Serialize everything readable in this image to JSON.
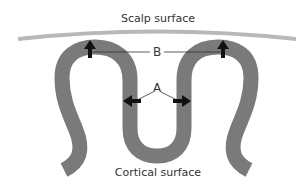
{
  "diagram": {
    "type": "cortical-folding-schematic",
    "labels": {
      "scalp_surface": "Scalp surface",
      "cortical_surface": "Cortical surface",
      "marker_b": "B",
      "marker_a": "A"
    },
    "annotations": [
      {
        "marker": "B",
        "arrows": 2,
        "arrow_direction": "up",
        "meaning": "gyral crown toward scalp"
      },
      {
        "marker": "A",
        "arrows": 2,
        "arrow_direction": "outward-horizontal",
        "meaning": "sulcal walls"
      }
    ],
    "colors": {
      "cortex_band": "#7a7a7a",
      "scalp_line": "#b8b8b8",
      "arrow": "#111111",
      "leader_line": "#333333",
      "text": "#333333",
      "background": "#ffffff"
    }
  }
}
